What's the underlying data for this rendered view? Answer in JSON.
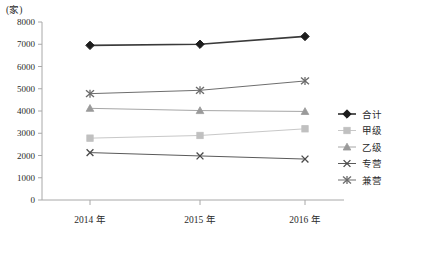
{
  "unit_label": "(家)",
  "chart_data": {
    "type": "line",
    "title": "",
    "xlabel": "",
    "ylabel": "",
    "unit": "家",
    "categories": [
      "2014 年",
      "2015 年",
      "2016 年"
    ],
    "ylim": [
      0,
      8000
    ],
    "ytick_labels": [
      "0",
      "1000",
      "2000",
      "3000",
      "4000",
      "5000",
      "6000",
      "7000",
      "8000"
    ],
    "ytick_values": [
      0,
      1000,
      2000,
      3000,
      4000,
      5000,
      6000,
      7000,
      8000
    ],
    "grid": false,
    "legend_position": "right",
    "series": [
      {
        "name": "合计",
        "marker": "diamond",
        "color": "#1c1c1c",
        "line_color": "#3a3a3a",
        "values": [
          6950,
          7000,
          7350
        ]
      },
      {
        "name": "甲级",
        "marker": "square",
        "color": "#c0c0c0",
        "line_color": "#c8c8c8",
        "values": [
          2780,
          2900,
          3200
        ]
      },
      {
        "name": "乙级",
        "marker": "triangle",
        "color": "#9a9a9a",
        "line_color": "#a6a6a6",
        "values": [
          4120,
          4020,
          3980
        ]
      },
      {
        "name": "专营",
        "marker": "x",
        "color": "#4a4a4a",
        "line_color": "#5a5a5a",
        "values": [
          2130,
          1980,
          1840
        ]
      },
      {
        "name": "兼营",
        "marker": "asterisk",
        "color": "#6a6a6a",
        "line_color": "#6e6e6e",
        "values": [
          4780,
          4930,
          5350
        ]
      }
    ]
  }
}
